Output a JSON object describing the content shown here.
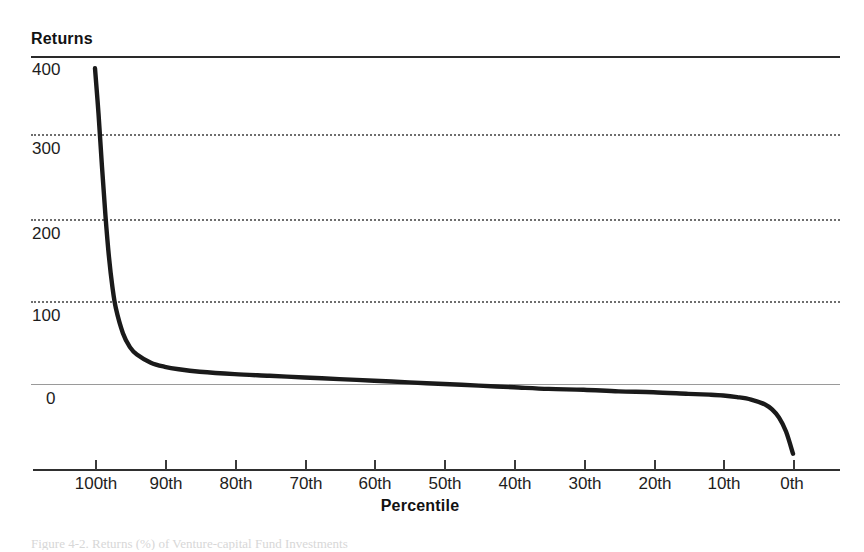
{
  "figure": {
    "y_axis_title": "Returns",
    "x_axis_title": "Percentile",
    "caption": "Figure 4-2.  Returns (%) of Venture-capital Fund Investments",
    "colors": {
      "curve": "#1a1a1a",
      "gridline": "#6e6e6e",
      "axis": "#2f2f2f",
      "zero_line": "#9a9a9a",
      "background": "#ffffff"
    }
  },
  "y_ticks": [
    {
      "label": "400"
    },
    {
      "label": "300"
    },
    {
      "label": "200"
    },
    {
      "label": "100"
    },
    {
      "label": "0"
    }
  ],
  "x_ticks": [
    {
      "label": "100th"
    },
    {
      "label": "90th"
    },
    {
      "label": "80th"
    },
    {
      "label": "70th"
    },
    {
      "label": "60th"
    },
    {
      "label": "50th"
    },
    {
      "label": "40th"
    },
    {
      "label": "30th"
    },
    {
      "label": "20th"
    },
    {
      "label": "10th"
    },
    {
      "label": "0th"
    }
  ],
  "chart_data": {
    "type": "line",
    "title": "",
    "xlabel": "Percentile",
    "ylabel": "Returns",
    "xlim": [
      100,
      0
    ],
    "ylim": [
      -60,
      400
    ],
    "x_reversed": true,
    "grid": "horizontal-dotted",
    "legend": "none",
    "yticks": [
      0,
      100,
      200,
      300,
      400
    ],
    "xticks": [
      100,
      90,
      80,
      70,
      60,
      50,
      40,
      30,
      20,
      10,
      0
    ],
    "series": [
      {
        "name": "Returns by percentile",
        "x": [
          100,
          99.5,
          99,
          98.5,
          98,
          97.5,
          97,
          96,
          95,
          94,
          92,
          90,
          88,
          85,
          80,
          75,
          70,
          65,
          60,
          55,
          50,
          45,
          40,
          35,
          30,
          25,
          20,
          15,
          12,
          10,
          8,
          6,
          4,
          3,
          2,
          1,
          0
        ],
        "y": [
          385,
          330,
          265,
          205,
          155,
          118,
          92,
          62,
          45,
          36,
          26,
          21,
          18,
          15,
          12,
          10,
          8,
          6,
          4,
          2,
          0,
          -2,
          -4,
          -6,
          -7,
          -9,
          -10,
          -12,
          -13,
          -14,
          -16,
          -19,
          -25,
          -31,
          -41,
          -58,
          -85
        ]
      }
    ]
  }
}
